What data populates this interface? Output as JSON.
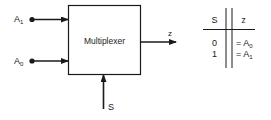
{
  "diagram": {
    "block": {
      "label": "Multiplexer"
    },
    "inputs": [
      {
        "name": "A",
        "subscript": "1"
      },
      {
        "name": "A",
        "subscript": "0"
      }
    ],
    "select": {
      "label": "S"
    },
    "output": {
      "label": "z"
    }
  },
  "truth_table": {
    "headers": [
      "S",
      "z"
    ],
    "rows": [
      {
        "s": "0",
        "z_prefix": "= A",
        "z_sub": "0"
      },
      {
        "s": "1",
        "z_prefix": "= A",
        "z_sub": "1"
      }
    ]
  }
}
